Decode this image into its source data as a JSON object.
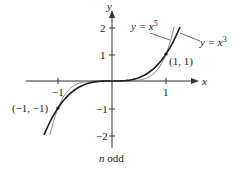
{
  "chart_data": {
    "type": "line",
    "title": "",
    "caption": "n odd",
    "xlabel": "x",
    "ylabel": "y",
    "xlim": [
      -1.6,
      1.6
    ],
    "ylim": [
      -2.5,
      2.5
    ],
    "x_ticks": [
      {
        "value": -1,
        "label": "−1"
      },
      {
        "value": 1,
        "label": "1"
      }
    ],
    "y_ticks": [
      {
        "value": 2,
        "label": "2"
      },
      {
        "value": 1,
        "label": "1"
      },
      {
        "value": -1,
        "label": "−1"
      },
      {
        "value": -2,
        "label": "−2"
      }
    ],
    "grid": false,
    "series": [
      {
        "name": "y = x^3",
        "label_text": "y = x",
        "exponent": "3",
        "function": "x^3",
        "color": "#1a1a1a",
        "width": 1.6,
        "x": [
          -1.26,
          -1,
          -0.5,
          0,
          0.5,
          1,
          1.26
        ],
        "y": [
          -2,
          -1,
          -0.125,
          0,
          0.125,
          1,
          2
        ]
      },
      {
        "name": "y = x^5",
        "label_text": "y = x",
        "exponent": "5",
        "function": "x^5",
        "color": "#8a8a8a",
        "width": 1.0,
        "x": [
          -1.149,
          -1,
          -0.5,
          0,
          0.5,
          1,
          1.149
        ],
        "y": [
          -2,
          -1,
          -0.03125,
          0,
          0.03125,
          1,
          2
        ]
      }
    ],
    "annotations": [
      {
        "text": "(1, 1)",
        "x": 1,
        "y": 1
      },
      {
        "text": "(−1, −1)",
        "x": -1,
        "y": -1
      }
    ]
  }
}
